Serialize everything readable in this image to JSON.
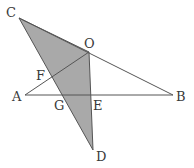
{
  "diagram": {
    "type": "geometry",
    "colors": {
      "shade": "#a9a9a9",
      "line": "#555555",
      "label": "#3a3a3a",
      "background": "#ffffff"
    },
    "points": {
      "C": {
        "label": "C",
        "x": 19,
        "y": 18,
        "lx": 6,
        "ly": 17
      },
      "O": {
        "label": "O",
        "x": 89,
        "y": 52,
        "lx": 84,
        "ly": 48
      },
      "A": {
        "label": "A",
        "x": 25,
        "y": 95,
        "lx": 12,
        "ly": 101
      },
      "B": {
        "label": "B",
        "x": 173,
        "y": 95,
        "lx": 176,
        "ly": 101
      },
      "F": {
        "label": "F",
        "x": 53,
        "y": 75,
        "lx": 36,
        "ly": 80
      },
      "G": {
        "label": "G",
        "x": 64,
        "y": 95,
        "lx": 54,
        "ly": 110
      },
      "E": {
        "label": "E",
        "x": 90,
        "y": 95,
        "lx": 93,
        "ly": 110
      },
      "D": {
        "label": "D",
        "x": 93,
        "y": 150,
        "lx": 96,
        "ly": 161
      }
    },
    "segments": [
      [
        "A",
        "B"
      ],
      [
        "A",
        "O"
      ],
      [
        "C",
        "B"
      ]
    ],
    "shaded_polygon": [
      "C",
      "O",
      "D"
    ]
  }
}
